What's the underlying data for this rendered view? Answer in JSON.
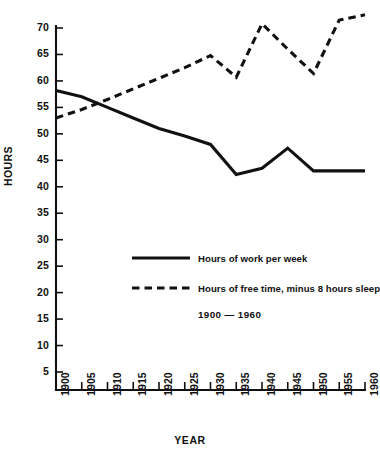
{
  "chart_data": {
    "type": "line",
    "title": "",
    "subtitle": "1900 — 1960",
    "xlabel": "YEAR",
    "ylabel": "HOURS",
    "grid": false,
    "legend_position": "inside-center",
    "x": [
      1900,
      1905,
      1910,
      1915,
      1920,
      1925,
      1930,
      1935,
      1940,
      1945,
      1950,
      1955,
      1960
    ],
    "xtick_labels": [
      "1900",
      "1905",
      "1910",
      "1915",
      "1920",
      "1925",
      "1930",
      "1935",
      "1940",
      "1945",
      "1950",
      "1955",
      "1960"
    ],
    "ytick_labels": [
      "70",
      "65",
      "60",
      "55",
      "50",
      "45",
      "40",
      "35",
      "30",
      "25",
      "20",
      "15",
      "10",
      "5"
    ],
    "ytick_values": [
      70,
      65,
      60,
      55,
      50,
      45,
      40,
      35,
      30,
      25,
      20,
      15,
      10,
      5
    ],
    "xlim": [
      1900,
      1960
    ],
    "ylim": [
      0,
      72.5
    ],
    "series": [
      {
        "name": "Hours of work per week",
        "style": "solid",
        "color": "#111111",
        "values": [
          58.2,
          57.0,
          55.0,
          53.0,
          51.0,
          49.6,
          48.0,
          42.3,
          43.5,
          47.3,
          43.0,
          43.0,
          43.0
        ]
      },
      {
        "name": "Hours of free time, minus 8 hours sleep",
        "style": "dashed",
        "color": "#111111",
        "values": [
          53.0,
          54.6,
          56.5,
          58.5,
          60.5,
          62.5,
          64.8,
          60.7,
          70.8,
          66.0,
          61.4,
          71.5,
          72.5
        ]
      }
    ]
  },
  "legend": {
    "items": [
      {
        "label": "Hours of work per week",
        "style": "solid"
      },
      {
        "label": "Hours of free time, minus 8 hours sleep",
        "style": "dashed"
      }
    ],
    "subtitle": "1900 — 1960"
  },
  "axes": {
    "y_title": "HOURS",
    "x_title": "YEAR"
  }
}
